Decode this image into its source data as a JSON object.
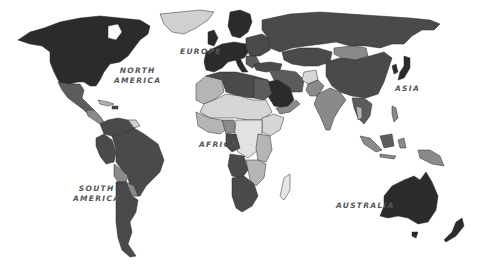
{
  "map": {
    "style": "grayscale choropleth world map",
    "labels": {
      "north_america": {
        "line1": "NORTH",
        "line2": "AMERICA"
      },
      "europe": {
        "line1": "EUROPE"
      },
      "asia": {
        "line1": "ASIA"
      },
      "africa": {
        "line1": "AFRICA"
      },
      "south_america": {
        "line1": "SOUTH",
        "line2": "AMERICA"
      },
      "australia": {
        "line1": "AUSTRALIA"
      }
    },
    "shades": {
      "darkest": "#2b2b2b",
      "dark": "#4a4a4a",
      "medium_dark": "#5c5c5c",
      "medium": "#8a8a8a",
      "light": "#b5b5b5",
      "lightest": "#d6d6d6",
      "label_color": "#555555",
      "background": "#ffffff"
    }
  }
}
